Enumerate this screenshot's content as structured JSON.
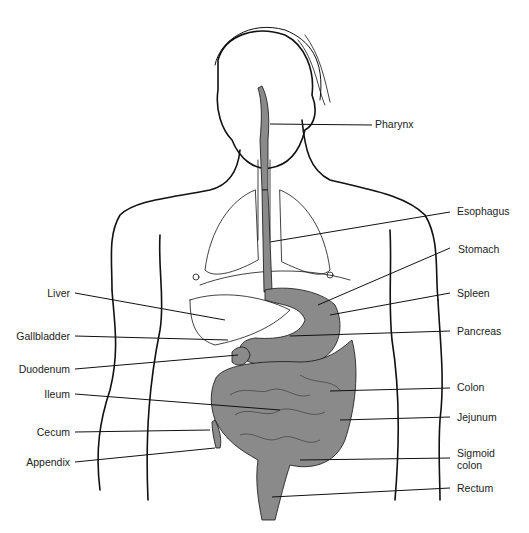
{
  "colors": {
    "organ_fill": "#8a8a8a",
    "line": "#111111",
    "background": "#ffffff"
  },
  "labels_left": [
    {
      "id": "liver",
      "text": "Liver"
    },
    {
      "id": "gallbladder",
      "text": "Gallbladder"
    },
    {
      "id": "duodenum",
      "text": "Duodenum"
    },
    {
      "id": "ileum",
      "text": "Ileum"
    },
    {
      "id": "cecum",
      "text": "Cecum"
    },
    {
      "id": "appendix",
      "text": "Appendix"
    }
  ],
  "labels_right": [
    {
      "id": "pharynx",
      "text": "Pharynx"
    },
    {
      "id": "esophagus",
      "text": "Esophagus"
    },
    {
      "id": "stomach",
      "text": "Stomach"
    },
    {
      "id": "spleen",
      "text": "Spleen"
    },
    {
      "id": "pancreas",
      "text": "Pancreas"
    },
    {
      "id": "colon",
      "text": "Colon"
    },
    {
      "id": "jejunum",
      "text": "Jejunum"
    },
    {
      "id": "sigmoid_colon_1",
      "text": "Sigmoid"
    },
    {
      "id": "sigmoid_colon_2",
      "text": "colon"
    },
    {
      "id": "rectum",
      "text": "Rectum"
    }
  ]
}
